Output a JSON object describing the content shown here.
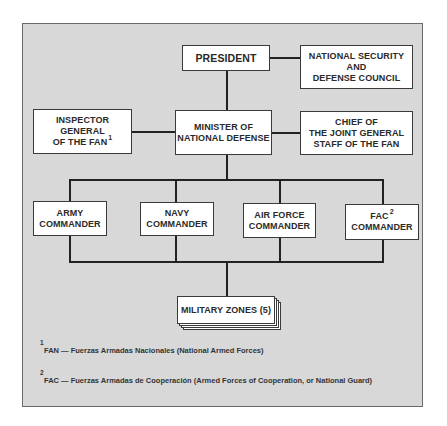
{
  "chart": {
    "president": "PRESIDENT",
    "nsdc": [
      "NATIONAL SECURITY",
      "AND",
      "DEFENSE COUNCIL"
    ],
    "inspector": [
      "INSPECTOR",
      "GENERAL",
      "OF THE FAN"
    ],
    "inspector_note": "1",
    "minister": [
      "MINISTER OF",
      "NATIONAL DEFENSE"
    ],
    "chief": [
      "CHIEF OF",
      "THE JOINT GENERAL",
      "STAFF OF THE FAN"
    ],
    "army": [
      "ARMY",
      "COMMANDER"
    ],
    "navy": [
      "NAVY",
      "COMMANDER"
    ],
    "airforce": [
      "AIR FORCE",
      "COMMANDER"
    ],
    "fac": [
      "FAC",
      "COMMANDER"
    ],
    "fac_note": "2",
    "zones": "MILITARY ZONES (5)"
  },
  "footnotes": [
    {
      "num": "1",
      "text": "FAN — Fuerzas Armadas Nacionales (National Armed Forces)"
    },
    {
      "num": "2",
      "text": "FAC — Fuerzas Armadas de Cooperación (Armed Forces of Cooperation, or National Guard)"
    }
  ]
}
